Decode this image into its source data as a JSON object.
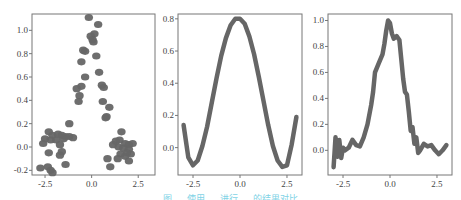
{
  "figure": {
    "caption": "图 … 使用 … 进行 … 的结果对比"
  },
  "chart_data": [
    {
      "type": "scatter",
      "title": "",
      "xlabel": "",
      "ylabel": "",
      "xlim": [
        -3.2,
        3.4
      ],
      "ylim": [
        -0.24,
        1.14
      ],
      "xticks": [
        -2.5,
        0.0,
        2.5
      ],
      "xtick_labels": [
        "-2.5",
        "0.0",
        "2.5"
      ],
      "yticks": [
        -0.2,
        0.0,
        0.2,
        0.4,
        0.6,
        0.8,
        1.0
      ],
      "ytick_labels": [
        "-0.2",
        "0.0",
        "0.2",
        "0.4",
        "0.6",
        "0.8",
        "1.0"
      ],
      "grid": false,
      "marker_color": "#666666",
      "points": [
        {
          "x": -0.15,
          "y": 1.11
        },
        {
          "x": 0.35,
          "y": 1.05
        },
        {
          "x": 0.15,
          "y": 0.97
        },
        {
          "x": -0.05,
          "y": 0.95
        },
        {
          "x": 0.05,
          "y": 0.92
        },
        {
          "x": 0.1,
          "y": 0.9
        },
        {
          "x": -0.45,
          "y": 0.83
        },
        {
          "x": -0.35,
          "y": 0.82
        },
        {
          "x": 0.25,
          "y": 0.78
        },
        {
          "x": -0.55,
          "y": 0.73
        },
        {
          "x": 0.4,
          "y": 0.64
        },
        {
          "x": -0.35,
          "y": 0.6
        },
        {
          "x": -0.55,
          "y": 0.52
        },
        {
          "x": 0.55,
          "y": 0.53
        },
        {
          "x": 0.65,
          "y": 0.51
        },
        {
          "x": -0.8,
          "y": 0.5
        },
        {
          "x": -0.65,
          "y": 0.44
        },
        {
          "x": -0.7,
          "y": 0.39
        },
        {
          "x": 0.6,
          "y": 0.39
        },
        {
          "x": 0.95,
          "y": 0.34
        },
        {
          "x": 0.8,
          "y": 0.26
        },
        {
          "x": 0.75,
          "y": 0.25
        },
        {
          "x": -1.2,
          "y": 0.2
        },
        {
          "x": -2.3,
          "y": 0.13
        },
        {
          "x": -2.1,
          "y": 0.1
        },
        {
          "x": -1.8,
          "y": 0.11
        },
        {
          "x": -1.6,
          "y": 0.1
        },
        {
          "x": -1.4,
          "y": 0.09
        },
        {
          "x": -1.2,
          "y": 0.09
        },
        {
          "x": -1.0,
          "y": 0.08
        },
        {
          "x": -2.5,
          "y": 0.07
        },
        {
          "x": -2.2,
          "y": 0.06
        },
        {
          "x": -1.9,
          "y": 0.06
        },
        {
          "x": -1.5,
          "y": 0.07
        },
        {
          "x": -2.6,
          "y": 0.03
        },
        {
          "x": -1.7,
          "y": 0.02
        },
        {
          "x": -2.3,
          "y": -0.05
        },
        {
          "x": -1.6,
          "y": -0.04
        },
        {
          "x": -1.7,
          "y": -0.07
        },
        {
          "x": -1.4,
          "y": -0.15
        },
        {
          "x": -2.75,
          "y": -0.18
        },
        {
          "x": -2.35,
          "y": -0.17
        },
        {
          "x": -2.2,
          "y": -0.2
        },
        {
          "x": -2.1,
          "y": -0.22
        },
        {
          "x": 1.6,
          "y": 0.13
        },
        {
          "x": 1.3,
          "y": 0.05
        },
        {
          "x": 1.5,
          "y": 0.06
        },
        {
          "x": 1.8,
          "y": 0.03
        },
        {
          "x": 2.0,
          "y": 0.02
        },
        {
          "x": 2.2,
          "y": 0.03
        },
        {
          "x": 1.15,
          "y": 0.02
        },
        {
          "x": 1.45,
          "y": 0.0
        },
        {
          "x": 1.7,
          "y": -0.01
        },
        {
          "x": 2.0,
          "y": -0.02
        },
        {
          "x": 1.9,
          "y": -0.05
        },
        {
          "x": 2.1,
          "y": -0.06
        },
        {
          "x": 1.55,
          "y": -0.06
        },
        {
          "x": 1.4,
          "y": -0.1
        },
        {
          "x": 1.8,
          "y": -0.08
        },
        {
          "x": 2.0,
          "y": -0.12
        },
        {
          "x": 0.85,
          "y": -0.1
        },
        {
          "x": 1.0,
          "y": -0.17
        }
      ]
    },
    {
      "type": "line",
      "title": "",
      "xlabel": "",
      "ylabel": "",
      "xlim": [
        -3.3,
        3.3
      ],
      "ylim": [
        -0.17,
        0.83
      ],
      "xticks": [
        -2.5,
        0.0,
        2.5
      ],
      "xtick_labels": [
        "-2.5",
        "0.0",
        "2.5"
      ],
      "yticks": [
        0.0,
        0.2,
        0.4,
        0.6,
        0.8
      ],
      "ytick_labels": [
        "0.0",
        "0.2",
        "0.4",
        "0.6",
        "0.8"
      ],
      "grid": false,
      "line_color": "#666666",
      "x": [
        -3.0,
        -2.75,
        -2.5,
        -2.25,
        -2.0,
        -1.75,
        -1.5,
        -1.25,
        -1.0,
        -0.75,
        -0.5,
        -0.25,
        0.0,
        0.25,
        0.5,
        0.75,
        1.0,
        1.25,
        1.5,
        1.75,
        2.0,
        2.25,
        2.5,
        2.75,
        3.0
      ],
      "y": [
        0.14,
        -0.06,
        -0.11,
        -0.08,
        0.01,
        0.13,
        0.28,
        0.43,
        0.57,
        0.68,
        0.76,
        0.8,
        0.8,
        0.77,
        0.69,
        0.58,
        0.44,
        0.29,
        0.14,
        0.01,
        -0.08,
        -0.12,
        -0.11,
        0.02,
        0.19
      ]
    },
    {
      "type": "line",
      "title": "",
      "xlabel": "",
      "ylabel": "",
      "xlim": [
        -3.3,
        3.3
      ],
      "ylim": [
        -0.19,
        1.05
      ],
      "xticks": [
        -2.5,
        0.0,
        2.5
      ],
      "xtick_labels": [
        "-2.5",
        "0.0",
        "2.5"
      ],
      "yticks": [
        0.0,
        0.2,
        0.4,
        0.6,
        0.8,
        1.0
      ],
      "ytick_labels": [
        "0.0",
        "0.2",
        "0.4",
        "0.6",
        "0.8",
        "1.0"
      ],
      "grid": false,
      "line_color": "#666666",
      "x": [
        -3.0,
        -2.9,
        -2.8,
        -2.7,
        -2.6,
        -2.5,
        -2.4,
        -2.2,
        -2.0,
        -1.8,
        -1.6,
        -1.4,
        -1.2,
        -1.0,
        -0.9,
        -0.8,
        -0.6,
        -0.4,
        -0.3,
        -0.2,
        -0.1,
        0.0,
        0.1,
        0.2,
        0.35,
        0.5,
        0.6,
        0.7,
        0.8,
        0.9,
        1.0,
        1.1,
        1.2,
        1.3,
        1.4,
        1.5,
        1.6,
        1.8,
        2.0,
        2.2,
        2.4,
        2.6,
        2.8,
        3.0
      ],
      "y": [
        -0.13,
        0.1,
        -0.05,
        0.08,
        -0.06,
        0.02,
        0.0,
        0.02,
        0.08,
        0.04,
        0.03,
        0.1,
        0.2,
        0.35,
        0.45,
        0.6,
        0.67,
        0.74,
        0.82,
        0.92,
        1.0,
        0.98,
        0.9,
        0.86,
        0.88,
        0.85,
        0.7,
        0.55,
        0.45,
        0.43,
        0.3,
        0.15,
        0.18,
        0.05,
        0.1,
        -0.02,
        0.0,
        0.05,
        0.03,
        0.04,
        0.0,
        -0.03,
        0.0,
        0.04
      ]
    }
  ]
}
